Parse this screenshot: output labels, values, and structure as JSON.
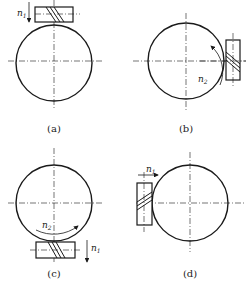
{
  "figure": {
    "panels": [
      {
        "id": "a",
        "caption": "(a)",
        "speed_label": "n",
        "speed_sub": "1",
        "description": "Worm above worm wheel, worm speed n1 arrow pointing down"
      },
      {
        "id": "b",
        "caption": "(b)",
        "speed_label": "n",
        "speed_sub": "2",
        "description": "Worm on right side of wheel, wheel rotation n2 curved arrow"
      },
      {
        "id": "c",
        "caption": "(c)",
        "speed_label_wheel": "n",
        "speed_sub_wheel": "2",
        "speed_label_worm": "n",
        "speed_sub_worm": "1",
        "description": "Worm below wheel, wheel rotation n2 curved arrow, worm n1 arrow pointing down"
      },
      {
        "id": "d",
        "caption": "(d)",
        "speed_label": "n",
        "speed_sub": "1",
        "description": "Worm on left side of wheel, n1 arrow pointing right"
      }
    ],
    "colors": {
      "stroke": "#1a1a1a",
      "background": "#ffffff"
    }
  }
}
